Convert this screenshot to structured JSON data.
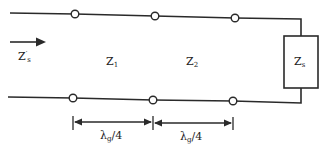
{
  "diagram": {
    "type": "transmission-line cascade of two quarter-wave sections",
    "colors": {
      "line": "#2a2a2a",
      "background": "#ffffff",
      "node_fill": "#ffffff"
    },
    "input_impedance": {
      "symbol": "Z",
      "prime": "′",
      "subscript": "s"
    },
    "sections": [
      {
        "symbol": "Z",
        "subscript": "1"
      },
      {
        "symbol": "Z",
        "subscript": "2"
      }
    ],
    "load": {
      "symbol": "Z",
      "subscript": "s"
    },
    "dimensions": [
      {
        "symbol": "λ",
        "subscript": "g",
        "suffix": "/4"
      },
      {
        "symbol": "λ",
        "subscript": "g",
        "suffix": "/4"
      }
    ]
  }
}
